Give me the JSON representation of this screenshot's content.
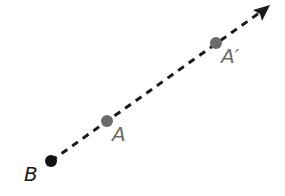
{
  "diagram": {
    "type": "ray-dilation",
    "ray": {
      "start": [
        51,
        161
      ],
      "end": [
        270,
        5
      ],
      "style": "dashed",
      "color": "#1a1a1a",
      "arrowhead": true
    },
    "points": [
      {
        "id": "B",
        "label": "B",
        "x": 51,
        "y": 161,
        "color": "#111111",
        "label_color": "#1a1a1a"
      },
      {
        "id": "A",
        "label": "A",
        "x": 107,
        "y": 121,
        "color": "#6b6b6b",
        "label_color": "#6b6b6b"
      },
      {
        "id": "A_prime",
        "label": "A′",
        "x": 216,
        "y": 43,
        "color": "#6b6b6b",
        "label_color": "#6b6b6b"
      }
    ]
  },
  "labels": {
    "b": "B",
    "a": "A",
    "a_prime": "A′"
  }
}
